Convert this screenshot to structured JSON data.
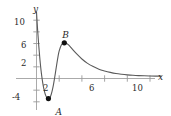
{
  "chart_data": {
    "type": "line",
    "title": "",
    "xlabel": "x",
    "ylabel": "y",
    "xlim": [
      -0.6,
      12.2
    ],
    "ylim": [
      -5.0,
      11.6
    ],
    "grid": false,
    "legend": null,
    "x_ticks": [
      2,
      6,
      10
    ],
    "x_tick_labels": [
      "2",
      "6",
      "10"
    ],
    "x_minor_ticks": [
      4,
      8
    ],
    "y_ticks": [
      2,
      6,
      10
    ],
    "y_tick_labels": [
      "2",
      "6",
      "10"
    ],
    "y_minor_ticks": [
      -2,
      4,
      8
    ],
    "y_neg_tick": -4,
    "y_neg_tick_label": "-4",
    "series": [
      {
        "name": "curve",
        "color": "#555555",
        "x": [
          0.0,
          0.1,
          0.2,
          0.3,
          0.4,
          0.5,
          0.6,
          0.7,
          0.8,
          0.9,
          1.0,
          1.1,
          1.2,
          1.3,
          1.4,
          1.5,
          1.6,
          1.7,
          1.8,
          1.9,
          2.0,
          2.2,
          2.4,
          2.6,
          2.8,
          3.0,
          3.2,
          3.5,
          4.0,
          4.5,
          5.0,
          5.5,
          6.0,
          6.5,
          7.0,
          7.5,
          8.0,
          8.5,
          9.0,
          9.5,
          10.0,
          10.5,
          11.0
        ],
        "y": [
          11.4,
          8.3,
          5.6,
          3.3,
          1.4,
          -0.1,
          -1.3,
          -2.2,
          -2.85,
          -3.25,
          -3.45,
          -3.42,
          -3.2,
          -2.7,
          -1.95,
          -1.0,
          0.15,
          1.4,
          2.65,
          3.8,
          4.75,
          5.8,
          6.1,
          6.05,
          5.8,
          5.4,
          4.95,
          4.3,
          3.35,
          2.6,
          2.05,
          1.6,
          1.3,
          1.05,
          0.85,
          0.72,
          0.62,
          0.55,
          0.5,
          0.46,
          0.43,
          0.41,
          0.4
        ]
      }
    ],
    "points": [
      {
        "label": "A",
        "x": 1.05,
        "y": -3.45,
        "label_dx": 7,
        "label_dy": 9
      },
      {
        "label": "B",
        "x": 2.45,
        "y": 6.12,
        "label_dx": -2,
        "label_dy": -12
      }
    ],
    "axis_color": "#9a9a9a",
    "curve_color": "#5a5a5a",
    "point_color": "#111111",
    "text_color": "#2b2b2b"
  },
  "labels": {
    "x_axis": "x",
    "y_axis": "y",
    "tick_x_2": "2",
    "tick_x_6": "6",
    "tick_x_10": "10",
    "tick_y_10": "10",
    "tick_y_6": "6",
    "tick_y_2": "2",
    "tick_y_neg4": "-4",
    "point_a": "A",
    "point_b": "B"
  }
}
